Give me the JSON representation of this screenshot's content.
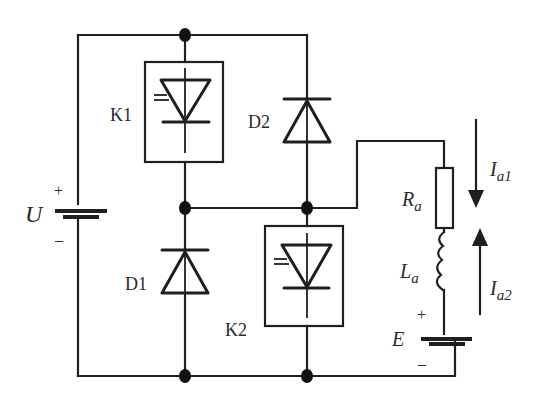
{
  "diagram": {
    "type": "circuit-schematic",
    "colors": {
      "line": "#1f1f1f",
      "node": "#111111",
      "text": "#2a2a2a",
      "background": "#ffffff"
    },
    "source": {
      "label": "U",
      "plus": "+",
      "minus": "–"
    },
    "switches": [
      {
        "id": "K1",
        "label": "K1",
        "icon": "thyristor-icon"
      },
      {
        "id": "K2",
        "label": "K2",
        "icon": "thyristor-icon"
      }
    ],
    "diodes": [
      {
        "id": "D1",
        "label": "D1"
      },
      {
        "id": "D2",
        "label": "D2"
      }
    ],
    "load": {
      "resistor": {
        "label_main": "R",
        "label_sub": "a"
      },
      "inductor": {
        "label_main": "L",
        "label_sub": "a"
      },
      "emf": {
        "label": "E",
        "plus": "+",
        "minus": "–"
      }
    },
    "currents": [
      {
        "id": "Ia1",
        "label_main": "I",
        "label_sub": "a1",
        "direction": "down"
      },
      {
        "id": "Ia2",
        "label_main": "I",
        "label_sub": "a2",
        "direction": "up"
      }
    ]
  }
}
